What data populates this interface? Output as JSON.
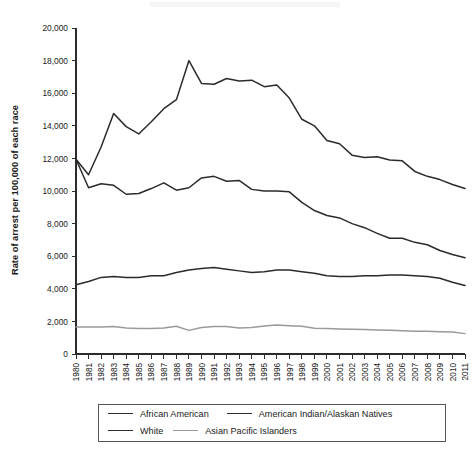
{
  "chart_data": {
    "type": "line",
    "title": "",
    "xlabel": "",
    "ylabel": "Rate of arrest per 100,000 of each race",
    "ylim": [
      0,
      20000
    ],
    "ytick_step": 2000,
    "grid": false,
    "legend_position": "bottom",
    "categories": [
      "1980",
      "1981",
      "1982",
      "1983",
      "1984",
      "1985",
      "1986",
      "1987",
      "1988",
      "1989",
      "1990",
      "1991",
      "1992",
      "1993",
      "1994",
      "1995",
      "1996",
      "1997",
      "1998",
      "1999",
      "2000",
      "2001",
      "2002",
      "2003",
      "2004",
      "2005",
      "2006",
      "2007",
      "2008",
      "2009",
      "2010",
      "2011"
    ],
    "ytick_labels": [
      "0",
      "2,000",
      "4,000",
      "6,000",
      "8,000",
      "10,000",
      "12,000",
      "14,000",
      "16,000",
      "18,000",
      "20,000"
    ],
    "ytick_values": [
      0,
      2000,
      4000,
      6000,
      8000,
      10000,
      12000,
      14000,
      16000,
      18000,
      20000
    ],
    "series": [
      {
        "name": "American Indian/Alaskan Natives",
        "color": "#2b2b2b",
        "width": 1.5,
        "values": [
          11950,
          11000,
          12700,
          14750,
          13950,
          13500,
          14250,
          15050,
          15600,
          18000,
          16600,
          16550,
          16900,
          16750,
          16800,
          16400,
          16500,
          15700,
          14400,
          14000,
          13100,
          12900,
          12200,
          12050,
          12100,
          11900,
          11850,
          11200,
          10900,
          10700,
          10400,
          10150
        ]
      },
      {
        "name": "African American",
        "color": "#2b2b2b",
        "width": 1.5,
        "values": [
          11950,
          10200,
          10450,
          10350,
          9800,
          9850,
          10150,
          10500,
          10050,
          10200,
          10800,
          10900,
          10600,
          10650,
          10100,
          10000,
          10000,
          9950,
          9300,
          8800,
          8500,
          8350,
          8000,
          7750,
          7400,
          7100,
          7100,
          6850,
          6700,
          6350,
          6100,
          5900
        ]
      },
      {
        "name": "White",
        "color": "#2b2b2b",
        "width": 1.5,
        "values": [
          4250,
          4450,
          4700,
          4750,
          4700,
          4700,
          4800,
          4800,
          5000,
          5150,
          5250,
          5300,
          5200,
          5100,
          5000,
          5050,
          5150,
          5150,
          5050,
          4950,
          4800,
          4750,
          4750,
          4800,
          4800,
          4850,
          4850,
          4800,
          4750,
          4650,
          4400,
          4200
        ]
      },
      {
        "name": "Asian Pacific Islanders",
        "color": "#9a9a9a",
        "width": 1.5,
        "values": [
          1650,
          1650,
          1650,
          1680,
          1600,
          1560,
          1570,
          1600,
          1700,
          1450,
          1620,
          1680,
          1680,
          1600,
          1620,
          1720,
          1780,
          1740,
          1700,
          1580,
          1560,
          1540,
          1520,
          1500,
          1470,
          1450,
          1420,
          1400,
          1390,
          1370,
          1350,
          1250
        ]
      }
    ]
  },
  "legend": {
    "rows": [
      [
        {
          "label": "African American",
          "color": "#2b2b2b"
        },
        {
          "label": "American Indian/Alaskan Natives",
          "color": "#2b2b2b"
        }
      ],
      [
        {
          "label": "White",
          "color": "#2b2b2b"
        },
        {
          "label": "Asian Pacific Islanders",
          "color": "#9a9a9a"
        }
      ]
    ]
  }
}
